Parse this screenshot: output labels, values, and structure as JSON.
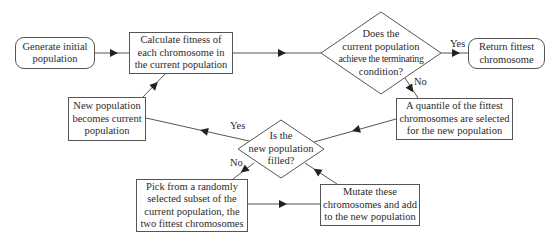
{
  "diagram": {
    "nodes": {
      "generate": {
        "label": "Generate initial population",
        "lines": [
          "Generate initial",
          "population"
        ],
        "shape": "rounded-rect"
      },
      "calculate": {
        "label": "Calculate fitness of each chromosome in the current population",
        "lines": [
          "Calculate fitness of",
          "each chromosome in",
          "the current population"
        ],
        "shape": "rect"
      },
      "terminate": {
        "label": "Does the current population achieve the terminating condition?",
        "lines": [
          "Does the",
          "current population",
          "achieve the terminating",
          "condition?"
        ],
        "shape": "diamond"
      },
      "return": {
        "label": "Return fittest chromosome",
        "lines": [
          "Return fittest",
          "chromosome"
        ],
        "shape": "rounded-rect"
      },
      "quantile": {
        "label": "A quantile of the fittest chromosomes are selected for the new population",
        "lines": [
          "A quantile of the fittest",
          "chromosomes are selected",
          "for the new population"
        ],
        "shape": "rect"
      },
      "filled": {
        "label": "Is the new population filled?",
        "lines": [
          "Is the",
          "new population",
          "filled?"
        ],
        "shape": "diamond"
      },
      "newpop": {
        "label": "New population becomes current population",
        "lines": [
          "New population",
          "becomes current",
          "population"
        ],
        "shape": "rect"
      },
      "pick": {
        "label": "Pick from a randomly selected subset of the current population, the two fittest chromosomes",
        "lines": [
          "Pick from a randomly",
          "selected subset of the",
          "current population, the",
          "two fittest chromosomes"
        ],
        "shape": "rect"
      },
      "mutate": {
        "label": "Mutate these chromosomes and add to the new population",
        "lines": [
          "Mutate these",
          "chromosomes and add",
          "to the new population"
        ],
        "shape": "rect"
      }
    },
    "edges": [
      {
        "from": "generate",
        "to": "calculate",
        "label": ""
      },
      {
        "from": "calculate",
        "to": "terminate",
        "label": ""
      },
      {
        "from": "terminate",
        "to": "return",
        "label": "Yes"
      },
      {
        "from": "terminate",
        "to": "quantile",
        "label": "No"
      },
      {
        "from": "quantile",
        "to": "filled",
        "label": ""
      },
      {
        "from": "filled",
        "to": "newpop",
        "label": "Yes"
      },
      {
        "from": "filled",
        "to": "pick",
        "label": "No"
      },
      {
        "from": "pick",
        "to": "mutate",
        "label": ""
      },
      {
        "from": "mutate",
        "to": "filled",
        "label": ""
      },
      {
        "from": "newpop",
        "to": "calculate",
        "label": ""
      }
    ],
    "edge_labels": {
      "terminate_yes": "Yes",
      "terminate_no": "No",
      "filled_yes": "Yes",
      "filled_no": "No"
    },
    "colors": {
      "stroke": "#555555",
      "text": "#2b2b2b",
      "background": "#ffffff"
    }
  }
}
